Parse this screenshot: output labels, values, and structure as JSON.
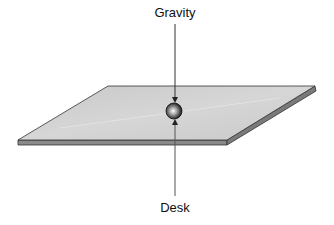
{
  "diagram": {
    "labels": {
      "top_force": "Gravity",
      "bottom_force": "Desk"
    },
    "colors": {
      "desk_top": "#cfcfcf",
      "desk_edge": "#777777",
      "line": "#333333"
    }
  }
}
